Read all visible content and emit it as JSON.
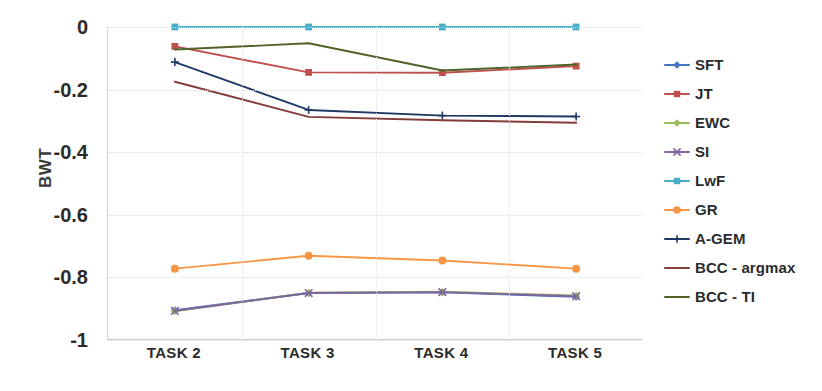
{
  "chart_data": {
    "type": "line",
    "title": "",
    "xlabel": "",
    "ylabel": "BWT",
    "categories": [
      "TASK 2",
      "TASK 3",
      "TASK 4",
      "TASK 5"
    ],
    "ylim": [
      -1,
      0
    ],
    "yticks": [
      "0",
      "-0.2",
      "-0.4",
      "-0.6",
      "-0.8",
      "-1"
    ],
    "ytick_values": [
      0,
      -0.2,
      -0.4,
      -0.6,
      -0.8,
      -1
    ],
    "grid": true,
    "legend_position": "right",
    "series": [
      {
        "name": "SFT",
        "color": "#4472c4",
        "marker": "diamond",
        "values": [
          -0.905,
          -0.85,
          -0.848,
          -0.862
        ]
      },
      {
        "name": "JT",
        "color": "#c0504d",
        "marker": "square",
        "values": [
          -0.062,
          -0.145,
          -0.146,
          -0.125
        ]
      },
      {
        "name": "EWC",
        "color": "#9bbb59",
        "marker": "diamond",
        "values": [
          -0.908,
          -0.849,
          -0.846,
          -0.858
        ]
      },
      {
        "name": "SI",
        "color": "#8064a2",
        "marker": "x",
        "values": [
          -0.907,
          -0.85,
          -0.847,
          -0.86
        ]
      },
      {
        "name": "LwF",
        "color": "#4bacc6",
        "marker": "square",
        "values": [
          0,
          0,
          0,
          0
        ]
      },
      {
        "name": "GR",
        "color": "#f79646",
        "marker": "circle",
        "values": [
          -0.772,
          -0.731,
          -0.746,
          -0.772
        ]
      },
      {
        "name": "A-GEM",
        "color": "#1f3864",
        "marker": "plus",
        "values": [
          -0.112,
          -0.265,
          -0.283,
          -0.286
        ]
      },
      {
        "name": "BCC - argmax",
        "color": "#843c39",
        "marker": "none",
        "values": [
          -0.175,
          -0.287,
          -0.298,
          -0.306
        ]
      },
      {
        "name": "BCC - TI",
        "color": "#4f6228",
        "marker": "none",
        "values": [
          -0.072,
          -0.052,
          -0.139,
          -0.12
        ]
      }
    ]
  }
}
